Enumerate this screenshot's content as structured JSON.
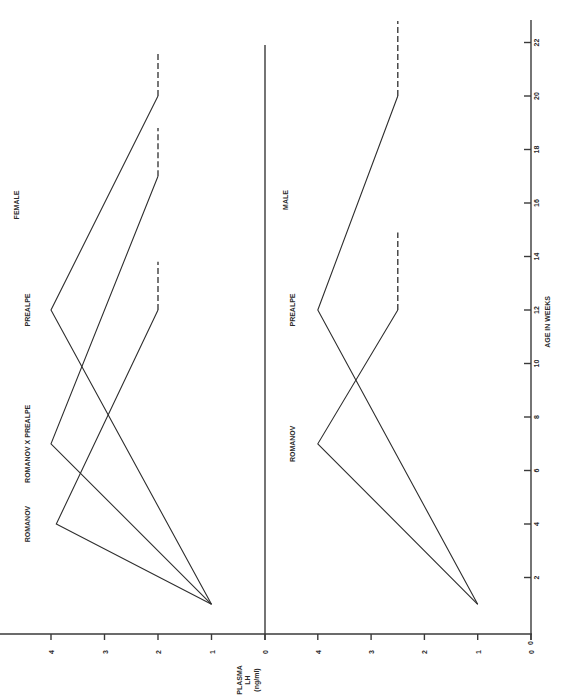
{
  "chart_data": [
    {
      "type": "line",
      "panel": "female",
      "title": "FEMALE",
      "xlabel": "AGE IN WEEKS",
      "ylabel": "PLASMA LH (ng/ml)",
      "x_ticks": [
        2,
        4,
        6,
        8,
        10,
        12,
        14,
        16,
        18,
        20,
        22
      ],
      "y_ticks": [
        0,
        1,
        2,
        3,
        4
      ],
      "xlim": [
        0,
        23
      ],
      "ylim": [
        0,
        4.5
      ],
      "orientation": "rotated-90",
      "series": [
        {
          "name": "ROMANOV",
          "x": [
            1,
            4,
            12
          ],
          "y": [
            1,
            3.9,
            2
          ],
          "dashed_extension": {
            "x": [
              12,
              13.8
            ],
            "y": [
              2,
              2
            ]
          }
        },
        {
          "name": "ROMANOV X PREALPE",
          "x": [
            1,
            7,
            17
          ],
          "y": [
            1,
            4,
            2
          ],
          "dashed_extension": {
            "x": [
              17,
              18.8
            ],
            "y": [
              2,
              2
            ]
          }
        },
        {
          "name": "PREALPE",
          "x": [
            1,
            12,
            20
          ],
          "y": [
            1,
            4,
            2
          ],
          "dashed_extension": {
            "x": [
              20,
              21.6
            ],
            "y": [
              2,
              2
            ]
          }
        }
      ]
    },
    {
      "type": "line",
      "panel": "male",
      "title": "MALE",
      "xlabel": "AGE IN WEEKS",
      "ylabel": "PLASMA LH (ng/ml)",
      "x_ticks": [
        0,
        2,
        4,
        6,
        8,
        10,
        12,
        14,
        16,
        18,
        20,
        22
      ],
      "y_ticks": [
        0,
        1,
        2,
        3,
        4
      ],
      "xlim": [
        0,
        23
      ],
      "ylim": [
        0,
        4.5
      ],
      "orientation": "rotated-90",
      "series": [
        {
          "name": "ROMANOV",
          "x": [
            1,
            7,
            12
          ],
          "y": [
            1,
            4,
            2.5
          ],
          "dashed_extension": {
            "x": [
              12,
              14.9
            ],
            "y": [
              2.5,
              2.5
            ]
          }
        },
        {
          "name": "PREALPE",
          "x": [
            1,
            12,
            20
          ],
          "y": [
            1,
            4,
            2.5
          ],
          "dashed_extension": {
            "x": [
              20,
              22.8
            ],
            "y": [
              2.5,
              2.5
            ]
          }
        }
      ]
    }
  ],
  "labels": {
    "female_title": "FEMALE",
    "male_title": "MALE",
    "x_axis": "AGE IN WEEKS",
    "y_axis_line1": "PLASMA",
    "y_axis_line2": "LH",
    "y_axis_line3": "(ng/ml)"
  },
  "colors": {
    "ink": "#2e2e2e",
    "background": "#ffffff"
  }
}
